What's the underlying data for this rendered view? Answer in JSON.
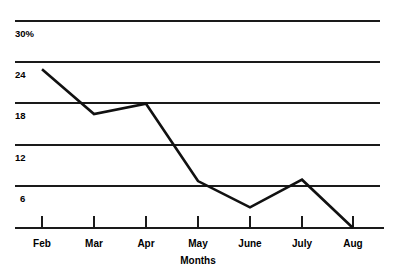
{
  "chart_data": {
    "type": "line",
    "title": "",
    "subtitle": "",
    "xlabel": "Months",
    "ylabel": "",
    "categories": [
      "Feb",
      "Mar",
      "Apr",
      "May",
      "June",
      "July",
      "Aug"
    ],
    "values": [
      23,
      16.5,
      18,
      6.8,
      3,
      7,
      0
    ],
    "series": [
      {
        "name": "",
        "values": [
          23,
          16.5,
          18,
          6.8,
          3,
          7,
          0
        ]
      }
    ],
    "ytick_labels": [
      "30%",
      "24",
      "18",
      "12",
      "6"
    ],
    "ytick_values": [
      30,
      24,
      18,
      12,
      6
    ],
    "ylim": [
      0,
      30
    ],
    "grid": true,
    "grid_axis": "y",
    "legend": "none",
    "line_color": "#111111",
    "grid_color": "#1a1a1a",
    "background_color": "#ffffff"
  },
  "axes": {
    "x_title": "Months",
    "x_categories": [
      {
        "label": "Feb"
      },
      {
        "label": "Mar"
      },
      {
        "label": "Apr"
      },
      {
        "label": "May"
      },
      {
        "label": "June"
      },
      {
        "label": "July"
      },
      {
        "label": "Aug"
      }
    ],
    "y_ticks": [
      {
        "label": "30%"
      },
      {
        "label": "24"
      },
      {
        "label": "18"
      },
      {
        "label": "12"
      },
      {
        "label": "6"
      }
    ]
  }
}
